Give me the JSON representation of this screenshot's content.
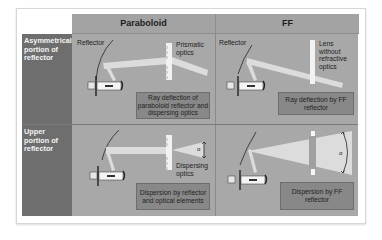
{
  "columns": [
    {
      "label": "Paraboloid"
    },
    {
      "label": "FF"
    }
  ],
  "rows": [
    {
      "label": "Asymmetrical portion of reflector"
    },
    {
      "label": "Upper portion of reflector"
    }
  ],
  "cells": {
    "asym_paraboloid": {
      "reflector_label": "Reflector",
      "optics_label": "Prismatic optics",
      "caption": "Ray deflection of paraboloid reflector and dispersing optics"
    },
    "asym_ff": {
      "reflector_label": "Reflector",
      "optics_label": "Lens without refractive optics",
      "caption": "Ray deflection by FF reflector"
    },
    "upper_paraboloid": {
      "optics_label": "Dispersing optics",
      "angle_symbol": "α",
      "caption": "Dispersion by reflector and optical elements"
    },
    "upper_ff": {
      "angle_symbol": "α",
      "caption": "Dispersion by FF reflector"
    }
  },
  "colors": {
    "header_bg": "#a3a3a3",
    "row_label_bg": "#6e6e6e",
    "cell_bg": "#a8a8a8",
    "caption_bg": "#888888",
    "beam": "#dcdcdc"
  }
}
